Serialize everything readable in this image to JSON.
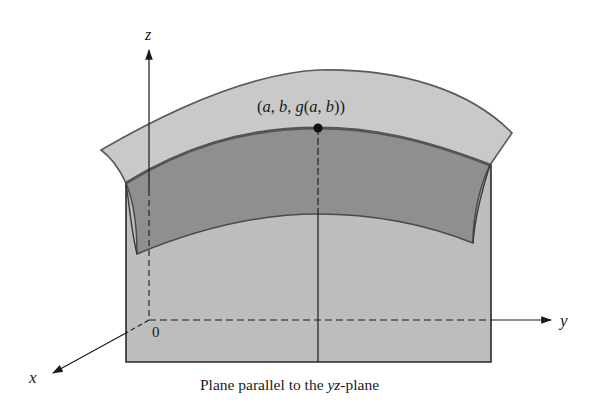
{
  "figure": {
    "axes": {
      "x_label": "x",
      "y_label": "y",
      "z_label": "z",
      "origin_label": "0"
    },
    "point_label": {
      "open": "(",
      "a": "a",
      "sep1": ", ",
      "b": "b",
      "sep2": ", ",
      "g": "g",
      "inner_open": "(",
      "a2": "a",
      "sep3": ", ",
      "b2": "b",
      "close": "))"
    },
    "caption": {
      "prefix": "Plane parallel to the ",
      "italic": "yz",
      "suffix": "-plane"
    },
    "colors": {
      "surface_light": "#c9c9c9",
      "surface_dark": "#8f8f8f",
      "plane": "#bdbdbd",
      "edge": "#555555",
      "ink": "#1a1a1a"
    }
  }
}
